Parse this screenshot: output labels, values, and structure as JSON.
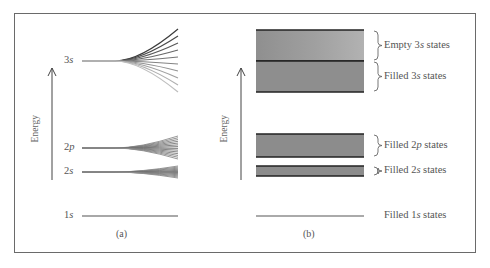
{
  "figure": {
    "panel_a": {
      "caption": "(a)",
      "axis_label": "Energy",
      "levels": [
        {
          "name": "3s",
          "num": "3",
          "orb": "s",
          "y": 61,
          "lines": 10,
          "spread_top": 29,
          "spread_bottom": 92
        },
        {
          "name": "2p",
          "num": "2",
          "orb": "p",
          "y": 148,
          "lines": 14,
          "spread_top": 136,
          "spread_bottom": 159
        },
        {
          "name": "2s",
          "num": "2",
          "orb": "s",
          "y": 172,
          "lines": 12,
          "spread_top": 166,
          "spread_bottom": 178
        },
        {
          "name": "1s",
          "num": "1",
          "orb": "s",
          "y": 216,
          "lines": 1,
          "spread_top": 216,
          "spread_bottom": 216
        }
      ]
    },
    "panel_b": {
      "caption": "(b)",
      "axis_label": "Energy",
      "bands": [
        {
          "name": "3s-empty",
          "top": 30,
          "bottom": 61,
          "fill": "#9a9a9a",
          "label_pre": "Empty ",
          "label_num": "3",
          "label_orb": "s",
          "label_post": " states"
        },
        {
          "name": "3s-filled",
          "top": 61,
          "bottom": 92,
          "fill": "#8e8e8e",
          "label_pre": "Filled ",
          "label_num": "3",
          "label_orb": "s",
          "label_post": " states"
        },
        {
          "name": "2p-filled",
          "top": 134,
          "bottom": 157,
          "fill": "#8c8c8c",
          "label_pre": "Filled ",
          "label_num": "2",
          "label_orb": "p",
          "label_post": " states"
        },
        {
          "name": "2s-filled",
          "top": 166,
          "bottom": 176,
          "fill": "#8c8c8c",
          "label_pre": "Filled ",
          "label_num": "2",
          "label_orb": "s",
          "label_post": " states"
        },
        {
          "name": "1s-filled",
          "top": 216,
          "bottom": 216,
          "fill": "#aaaaaa",
          "label_pre": "Filled ",
          "label_num": "1",
          "label_orb": "s",
          "label_post": " states"
        }
      ]
    },
    "colors": {
      "frame": "#6a6a6a",
      "line_dark": "#222222",
      "line_light": "#aaaaaa",
      "text": "#555555"
    }
  }
}
